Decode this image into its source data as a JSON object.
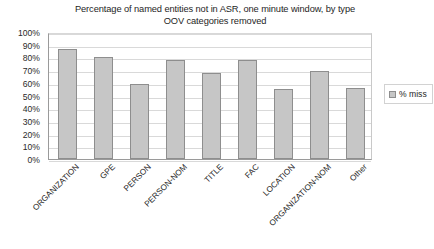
{
  "chart_data": {
    "type": "bar",
    "title": "Percentage of named entities not in ASR, one minute window, by type",
    "subtitle": "OOV categories removed",
    "xlabel": "",
    "ylabel": "",
    "ylim": [
      0,
      100
    ],
    "grid": true,
    "legend_position": "right",
    "categories": [
      "ORGANIZATION",
      "GPE",
      "PERSON",
      "PERSON-NOM",
      "TITLE",
      "FAC",
      "LOCATION",
      "ORGANIZATION-NOM",
      "Other"
    ],
    "series": [
      {
        "name": "% miss",
        "color": "#c6c6c6",
        "values": [
          87,
          80,
          59,
          78,
          68,
          78,
          55,
          69,
          56
        ]
      }
    ],
    "y_ticks": [
      "0%",
      "10%",
      "20%",
      "30%",
      "40%",
      "50%",
      "60%",
      "70%",
      "80%",
      "90%",
      "100%"
    ],
    "y_tick_values": [
      0,
      10,
      20,
      30,
      40,
      50,
      60,
      70,
      80,
      90,
      100
    ]
  },
  "legend": {
    "entries": [
      {
        "label": "% miss",
        "color": "#c6c6c6"
      }
    ]
  }
}
